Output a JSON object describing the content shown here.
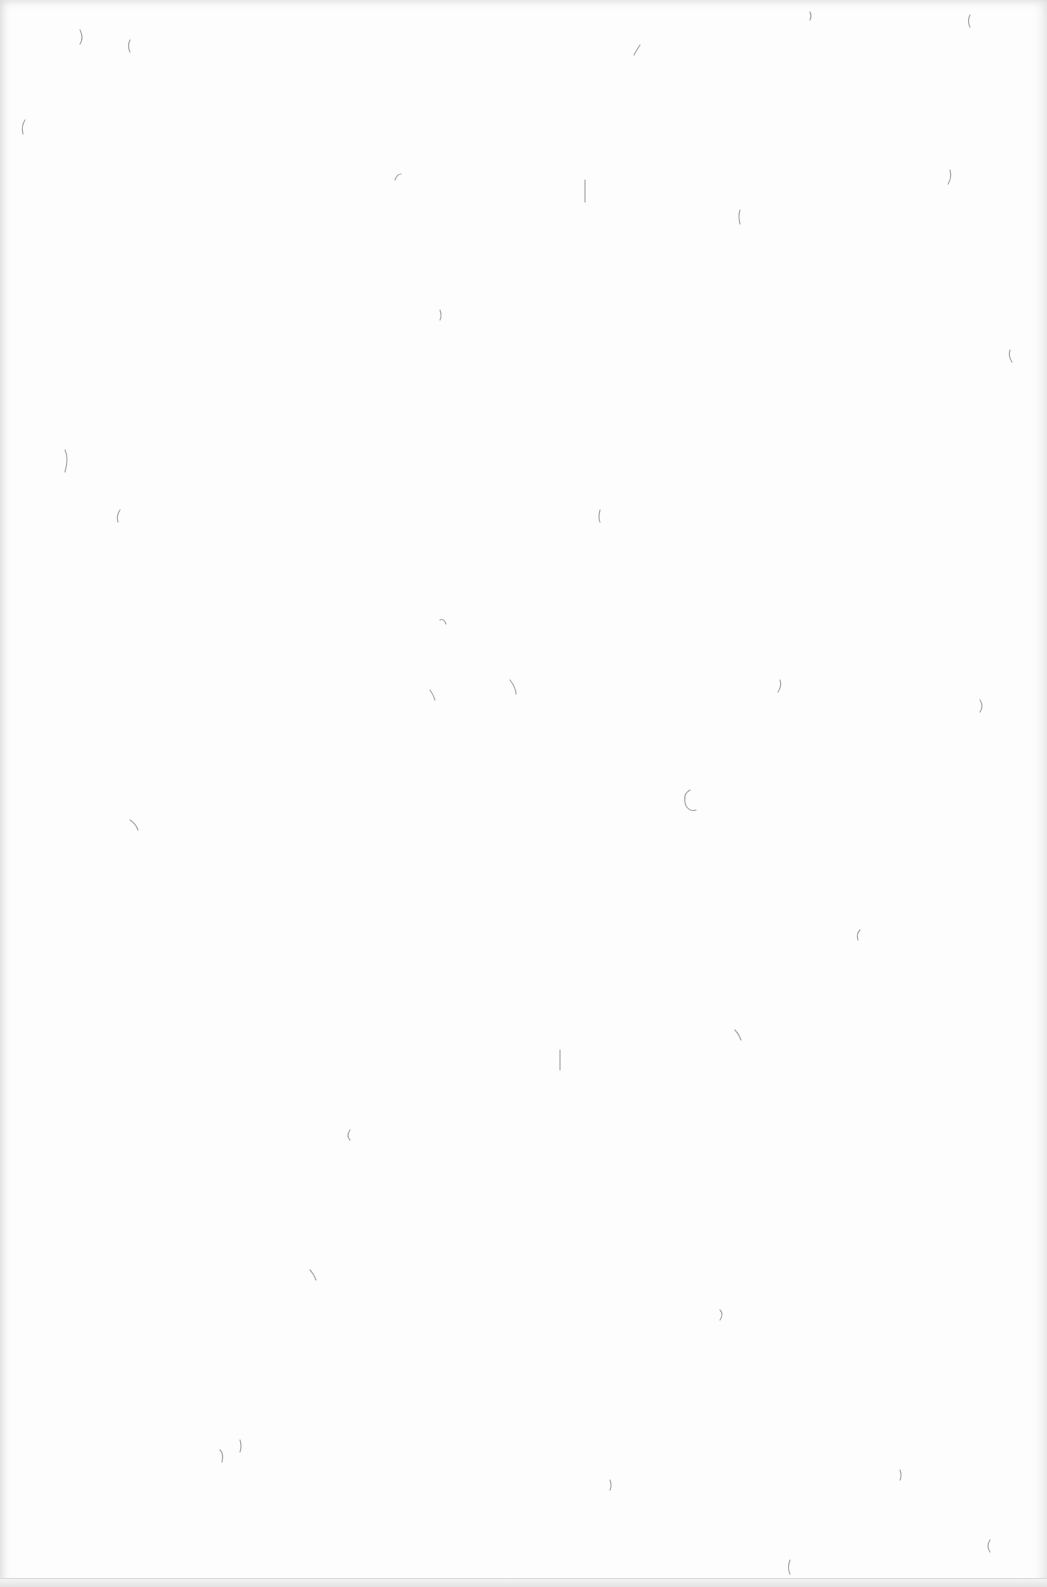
{
  "scene": {
    "description": "Blank sheet of textured paper with scattered fiber flecks",
    "paper_color": "#fdfdfd",
    "fiber_color": "#9a9a9a"
  }
}
